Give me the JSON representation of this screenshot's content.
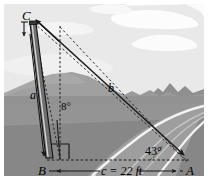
{
  "figure": {
    "type": "trigonometry-diagram",
    "scene": {
      "sky_color": "#e9e9e9",
      "cloud_color": "#fbfbfb",
      "far_mountain_color": "#9d9d9d",
      "mid_mountain_color": "#8e8e8e",
      "ground_color": "#8a8a8a",
      "ground_far_color": "#a2a2a2",
      "road_color": "#9b9b9b",
      "road_line_color": "#f2f2f2",
      "frame_color": "#ffffff",
      "stroke_color": "#1a1a1a",
      "pole_fill": "#6e6e6e",
      "pole_highlight": "#d8d8d8"
    },
    "vertices": {
      "C": {
        "label": "C",
        "x": 27,
        "y": 16
      },
      "B": {
        "label": "B",
        "x": 43,
        "y": 170
      },
      "A": {
        "label": "A",
        "x": 190,
        "y": 170
      }
    },
    "sides": [
      {
        "name": "a",
        "label": "a",
        "x": 33,
        "y": 95,
        "from": "B",
        "to": "C"
      },
      {
        "name": "b",
        "label": "b",
        "x": 112,
        "y": 88,
        "from": "C",
        "to": "A"
      },
      {
        "name": "c",
        "label": "c = 22 ft",
        "x": 118,
        "y": 171,
        "from": "B",
        "to": "A"
      }
    ],
    "angles": [
      {
        "name": "angle-at-pole",
        "label": "8°",
        "x": 66,
        "y": 105,
        "vertex": "B",
        "between": "pole and vertical"
      },
      {
        "name": "angle-at-A",
        "label": "43°",
        "x": 157,
        "y": 150,
        "vertex": "A",
        "between": "AC and AB"
      }
    ],
    "markers": {
      "right_angle_at_B": true,
      "vertical_dashed_from_B": true,
      "dimension_arrow_c": true,
      "pole_height_arrow": true
    }
  }
}
